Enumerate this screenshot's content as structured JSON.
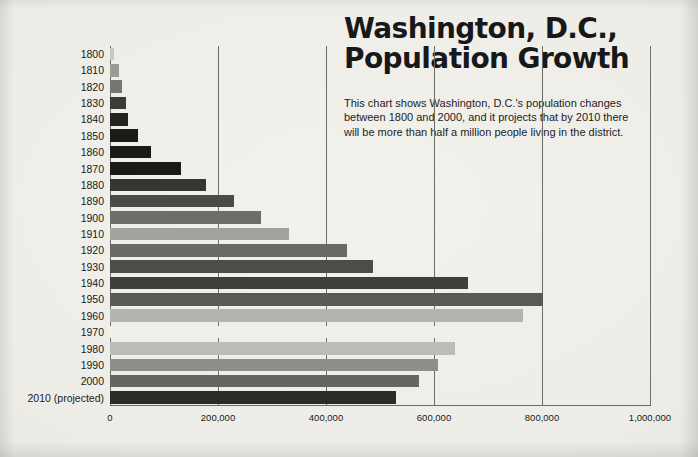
{
  "headline": {
    "line1": "Washington, D.C.,",
    "line2": "Population Growth"
  },
  "blurb": {
    "text": "This chart shows Washington, D.C.'s population changes between 1800 and 2000, and it projects that by 2010 there will be more than half a million people living in the district."
  },
  "colors": {
    "ink": "#181818",
    "grid": "#6e6c68",
    "paper": "#f0eee9"
  },
  "chart_data": {
    "type": "bar",
    "orientation": "horizontal",
    "title": "Washington, D.C., Population Growth",
    "xlabel": "",
    "ylabel": "",
    "xlim": [
      0,
      1000000
    ],
    "grid": true,
    "legend": "none",
    "xticks": [
      0,
      200000,
      400000,
      600000,
      800000,
      1000000
    ],
    "xticklabels": [
      "0",
      "200,000",
      "400,000",
      "600,000",
      "800,000",
      "1,000,000"
    ],
    "categories": [
      "1800",
      "1810",
      "1820",
      "1830",
      "1840",
      "1850",
      "1860",
      "1870",
      "1880",
      "1890",
      "1900",
      "1910",
      "1920",
      "1930",
      "1940",
      "1950",
      "1960",
      "1970",
      "1980",
      "1990",
      "2000",
      "2010 (projected)"
    ],
    "values": [
      8000,
      16000,
      23000,
      30000,
      34000,
      52000,
      75000,
      132000,
      178000,
      230000,
      279000,
      331000,
      438000,
      487000,
      663000,
      802000,
      764000,
      757000,
      638000,
      607000,
      572000,
      530000
    ],
    "bar_colors": [
      "#c9c7c2",
      "#9b9a95",
      "#777672",
      "#3a3a39",
      "#232322",
      "#1b1b1a",
      "#1a1a19",
      "#1a1a19",
      "#353533",
      "#4a4a48",
      "#6e6d69",
      "#a3a29d",
      "#6a6965",
      "#4d4c4a",
      "#3f3e3c",
      "#5a5956",
      "#b4b3ae",
      "#f0efea",
      "#bcbbb6",
      "#8e8d89",
      "#66655f",
      "#2b2b29"
    ]
  }
}
